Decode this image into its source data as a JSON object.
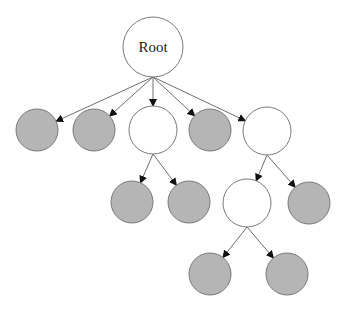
{
  "diagram": {
    "type": "tree",
    "colors": {
      "leaf_fill": "#b5b5b5",
      "internal_fill": "#ffffff",
      "stroke": "#7a7a7a",
      "edge": "#6e6e6e"
    },
    "nodes": [
      {
        "id": "root",
        "label": "Root",
        "kind": "internal"
      },
      {
        "id": "n1",
        "label": "",
        "kind": "leaf"
      },
      {
        "id": "n2",
        "label": "",
        "kind": "leaf"
      },
      {
        "id": "n3",
        "label": "",
        "kind": "internal"
      },
      {
        "id": "n4",
        "label": "",
        "kind": "leaf"
      },
      {
        "id": "n5",
        "label": "",
        "kind": "internal"
      },
      {
        "id": "n3a",
        "label": "",
        "kind": "leaf"
      },
      {
        "id": "n3b",
        "label": "",
        "kind": "leaf"
      },
      {
        "id": "n5a",
        "label": "",
        "kind": "internal"
      },
      {
        "id": "n5b",
        "label": "",
        "kind": "leaf"
      },
      {
        "id": "n5a1",
        "label": "",
        "kind": "leaf"
      },
      {
        "id": "n5a2",
        "label": "",
        "kind": "leaf"
      }
    ],
    "edges": [
      {
        "from": "root",
        "to": "n1"
      },
      {
        "from": "root",
        "to": "n2"
      },
      {
        "from": "root",
        "to": "n3"
      },
      {
        "from": "root",
        "to": "n4"
      },
      {
        "from": "root",
        "to": "n5"
      },
      {
        "from": "n3",
        "to": "n3a"
      },
      {
        "from": "n3",
        "to": "n3b"
      },
      {
        "from": "n5",
        "to": "n5a"
      },
      {
        "from": "n5",
        "to": "n5b"
      },
      {
        "from": "n5a",
        "to": "n5a1"
      },
      {
        "from": "n5a",
        "to": "n5a2"
      }
    ]
  }
}
